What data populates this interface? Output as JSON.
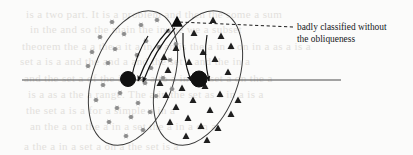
{
  "figure": {
    "name": "oblique-classification-diagram",
    "background_color": "#fbfbfa",
    "ink_color": "#1a1a1a",
    "width": 413,
    "height": 155
  },
  "annotation": {
    "line1": "badly classified without",
    "line2": "the obliqueness",
    "leader_style": "dashed",
    "leader_from": [
      293,
      27
    ],
    "leader_to": [
      178,
      22
    ]
  },
  "axis": {
    "name": "horizontal-decision-line",
    "x1": 22,
    "y1": 80,
    "x2": 341,
    "y2": 80,
    "color": "#4a4a4a"
  },
  "clusters": [
    {
      "id": "cluster-left",
      "marker": "star",
      "marker_color": "#8c8c8c",
      "ellipse": {
        "cx": 133,
        "cy": 78,
        "rx": 40,
        "ry": 70,
        "rotation": 20
      },
      "centroid": {
        "cx": 128,
        "cy": 79,
        "r": 7.5,
        "color": "#111111"
      },
      "points": [
        [
          112,
          22
        ],
        [
          141,
          25
        ],
        [
          157,
          20
        ],
        [
          100,
          37
        ],
        [
          124,
          34
        ],
        [
          146,
          41
        ],
        [
          168,
          31
        ],
        [
          92,
          52
        ],
        [
          115,
          49
        ],
        [
          137,
          55
        ],
        [
          159,
          47
        ],
        [
          176,
          44
        ],
        [
          88,
          66
        ],
        [
          108,
          63
        ],
        [
          151,
          68
        ],
        [
          170,
          60
        ],
        [
          103,
          85
        ],
        [
          120,
          93
        ],
        [
          145,
          83
        ],
        [
          163,
          78
        ],
        [
          96,
          100
        ],
        [
          117,
          108
        ],
        [
          138,
          103
        ],
        [
          156,
          96
        ],
        [
          109,
          122
        ],
        [
          131,
          117
        ],
        [
          150,
          112
        ],
        [
          126,
          136
        ],
        [
          143,
          130
        ],
        [
          172,
          89
        ]
      ]
    },
    {
      "id": "cluster-right",
      "marker": "triangle",
      "marker_color": "#1f1f1f",
      "ellipse": {
        "cx": 198,
        "cy": 78,
        "rx": 40,
        "ry": 70,
        "rotation": 20
      },
      "centroid": {
        "cx": 199,
        "cy": 79,
        "r": 8.0,
        "color": "#111111"
      },
      "points": [
        [
          213,
          20
        ],
        [
          194,
          33
        ],
        [
          221,
          36
        ],
        [
          231,
          46
        ],
        [
          176,
          48
        ],
        [
          203,
          52
        ],
        [
          189,
          62
        ],
        [
          215,
          59
        ],
        [
          168,
          70
        ],
        [
          228,
          72
        ],
        [
          182,
          88
        ],
        [
          205,
          86
        ],
        [
          220,
          94
        ],
        [
          166,
          95
        ],
        [
          193,
          100
        ],
        [
          238,
          100
        ],
        [
          176,
          107
        ],
        [
          210,
          110
        ],
        [
          188,
          118
        ],
        [
          231,
          114
        ],
        [
          170,
          122
        ],
        [
          201,
          126
        ],
        [
          218,
          128
        ],
        [
          186,
          136
        ],
        [
          207,
          140
        ],
        [
          160,
          83
        ],
        [
          164,
          57
        ]
      ]
    }
  ],
  "misclassified_point": {
    "name": "misclassified-sample",
    "cx": 177,
    "cy": 22,
    "label": "misclassified point"
  },
  "projection_arrows": [
    {
      "name": "arrow-to-left-centroid-a",
      "x1": 169,
      "y1": 29,
      "x2": 138,
      "y2": 81
    },
    {
      "name": "arrow-to-left-centroid-b",
      "x1": 175,
      "y1": 28,
      "x2": 143,
      "y2": 82
    },
    {
      "name": "arrow-to-left-outer",
      "x1": 148,
      "y1": 36,
      "x2": 131,
      "y2": 80
    },
    {
      "name": "arrow-to-right-centroid-a",
      "x1": 183,
      "y1": 33,
      "x2": 191,
      "y2": 81
    },
    {
      "name": "arrow-to-right-centroid-b",
      "x1": 207,
      "y1": 35,
      "x2": 209,
      "y2": 81
    }
  ],
  "background_ghost_text": [
    {
      "text": "is a two part. It is a problem and then the some a sum",
      "x": 26,
      "y": 8
    },
    {
      "text": "in the and so the main the in the we a subset",
      "x": 30,
      "y": 23
    },
    {
      "text": "theorem the a a the a it a in a an is the a in a on in a as a is a",
      "x": 22,
      "y": 40
    },
    {
      "text": "set a is a and the and a and the set a and the in a",
      "x": 20,
      "y": 55
    },
    {
      "text": "and the set a of the is a in a to a in the set a on the a",
      "x": 24,
      "y": 72
    },
    {
      "text": "is a as a the a range. The a in the set as a in a is a",
      "x": 28,
      "y": 88
    },
    {
      "text": "the set a is a for a simple a in a",
      "x": 26,
      "y": 104
    },
    {
      "text": "an the a on the a in a set the a in a on a",
      "x": 30,
      "y": 120
    },
    {
      "text": "a the a in a set a on a the set is a",
      "x": 24,
      "y": 140
    }
  ]
}
